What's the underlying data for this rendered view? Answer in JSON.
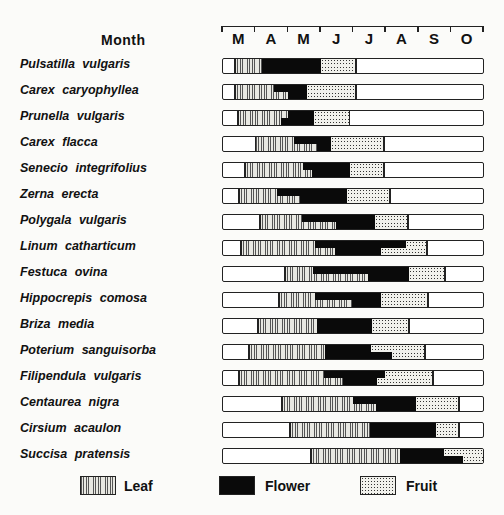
{
  "chart_data": {
    "type": "bar",
    "subtype": "phenology-timeline",
    "title": "",
    "axis_title": "Month",
    "months": [
      "M",
      "A",
      "M",
      "J",
      "J",
      "A",
      "S",
      "O"
    ],
    "axis_px": {
      "start": 222,
      "end": 483
    },
    "legend": [
      {
        "name": "Leaf",
        "pattern": "vertical-hatch"
      },
      {
        "name": "Flower",
        "pattern": "solid-black"
      },
      {
        "name": "Fruit",
        "pattern": "stipple"
      }
    ],
    "note": "Values are month positions (0 = start of March, 8 = end of October). Flower/fruit boundaries are staggered: top = upper half of bar, bottom = lower half.",
    "series": [
      {
        "species": "Pulsatilla vulgaris",
        "leaf_start": 0.37,
        "flower_top": 1.2,
        "flower_bottom": 1.2,
        "fruit_top": 3.02,
        "fruit_bottom": 3.02,
        "end": 4.09
      },
      {
        "species": "Carex caryophyllea",
        "leaf_start": 0.37,
        "flower_top": 1.56,
        "flower_bottom": 2.0,
        "fruit_top": 2.58,
        "fruit_bottom": 2.58,
        "end": 4.09
      },
      {
        "species": "Prunella vulgaris",
        "leaf_start": 0.46,
        "flower_top": 2.0,
        "flower_bottom": 1.78,
        "fruit_top": 2.8,
        "fruit_bottom": 2.8,
        "end": 3.89
      },
      {
        "species": "Carex flacca",
        "leaf_start": 1.0,
        "flower_top": 2.18,
        "flower_bottom": 2.89,
        "fruit_top": 3.31,
        "fruit_bottom": 3.31,
        "end": 4.95
      },
      {
        "species": "Senecio integrifolius",
        "leaf_start": 0.68,
        "flower_top": 2.46,
        "flower_bottom": 2.74,
        "fruit_top": 3.92,
        "fruit_bottom": 3.92,
        "end": 4.95
      },
      {
        "species": "Zerna erecta",
        "leaf_start": 0.49,
        "flower_top": 1.66,
        "flower_bottom": 2.37,
        "fruit_top": 3.83,
        "fruit_bottom": 3.83,
        "end": 5.14
      },
      {
        "species": "Polygala vulgaris",
        "leaf_start": 1.14,
        "flower_top": 2.43,
        "flower_bottom": 3.48,
        "fruit_top": 4.68,
        "fruit_bottom": 4.68,
        "end": 5.69
      },
      {
        "species": "Linum catharticum",
        "leaf_start": 0.55,
        "flower_top": 2.83,
        "flower_bottom": 3.45,
        "fruit_top": 5.63,
        "fruit_bottom": 4.86,
        "end": 6.28
      },
      {
        "species": "Festuca ovina",
        "leaf_start": 1.91,
        "flower_top": 2.77,
        "flower_bottom": 4.46,
        "fruit_top": 5.72,
        "fruit_bottom": 5.72,
        "end": 6.83
      },
      {
        "species": "Hippocrepis comosa",
        "leaf_start": 1.72,
        "flower_top": 2.83,
        "flower_bottom": 3.97,
        "fruit_top": 4.86,
        "fruit_bottom": 4.86,
        "end": 6.31
      },
      {
        "species": "Briza media",
        "leaf_start": 1.08,
        "flower_top": 2.89,
        "flower_bottom": 2.89,
        "fruit_top": 4.58,
        "fruit_bottom": 4.58,
        "end": 5.72
      },
      {
        "species": "Poterium sanguisorba",
        "leaf_start": 0.8,
        "flower_top": 3.14,
        "flower_bottom": 3.14,
        "fruit_top": 4.55,
        "fruit_bottom": 5.2,
        "end": 6.22
      },
      {
        "species": "Filipendula vulgaris",
        "leaf_start": 0.49,
        "flower_top": 3.11,
        "flower_bottom": 3.69,
        "fruit_top": 4.98,
        "fruit_bottom": 4.74,
        "end": 6.46
      },
      {
        "species": "Centaurea nigra",
        "leaf_start": 1.82,
        "flower_top": 4.0,
        "flower_bottom": 4.71,
        "fruit_top": 5.94,
        "fruit_bottom": 5.94,
        "end": 7.26
      },
      {
        "species": "Cirsium acaulon",
        "leaf_start": 2.06,
        "flower_top": 4.52,
        "flower_bottom": 4.52,
        "fruit_top": 6.55,
        "fruit_bottom": 6.55,
        "end": 7.26
      },
      {
        "species": "Succisa pratensis",
        "leaf_start": 2.71,
        "flower_top": 5.45,
        "flower_bottom": 5.45,
        "fruit_top": 6.8,
        "fruit_bottom": 7.38,
        "end": 8.0
      }
    ]
  }
}
